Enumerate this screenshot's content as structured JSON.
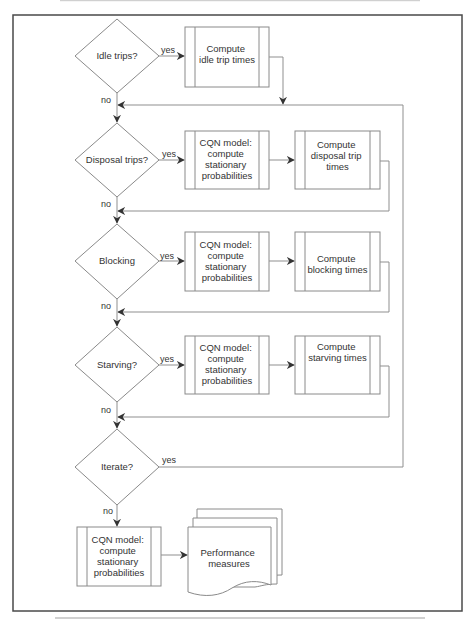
{
  "diagram": {
    "type": "flowchart",
    "colors": {
      "frame": "#4a4a4a",
      "shape_stroke": "#8a8a8a",
      "edge": "#8f8f8f",
      "text": "#333333",
      "background": "#ffffff"
    },
    "decisions": [
      {
        "id": "idle",
        "label": "Idle trips?",
        "yes_label": "yes",
        "no_label": "no"
      },
      {
        "id": "disposal",
        "label": "Disposal trips?",
        "yes_label": "yes",
        "no_label": "no"
      },
      {
        "id": "blocking",
        "label": "Blocking",
        "yes_label": "yes",
        "no_label": "no"
      },
      {
        "id": "starving",
        "label": "Starving?",
        "yes_label": "yes",
        "no_label": "no"
      },
      {
        "id": "iterate",
        "label": "Iterate?",
        "yes_label": "yes",
        "no_label": "no"
      }
    ],
    "processes": {
      "idle_compute": {
        "lines": [
          "Compute",
          "idle trip times"
        ]
      },
      "disposal_cqn": {
        "lines": [
          "CQN model:",
          "compute",
          "stationary",
          "probabilities"
        ]
      },
      "disposal_compute": {
        "lines": [
          "Compute",
          "disposal trip",
          "times"
        ]
      },
      "blocking_cqn": {
        "lines": [
          "CQN model:",
          "compute",
          "stationary",
          "probabilities"
        ]
      },
      "blocking_compute": {
        "lines": [
          "Compute",
          "blocking times"
        ]
      },
      "starving_cqn": {
        "lines": [
          "CQN model:",
          "compute",
          "stationary",
          "probabilities"
        ]
      },
      "starving_compute": {
        "lines": [
          "Compute",
          "starving times"
        ]
      },
      "final_cqn": {
        "lines": [
          "CQN model:",
          "compute",
          "stationary",
          "probabilities"
        ]
      }
    },
    "output_document": {
      "lines": [
        "Performance",
        "measures"
      ]
    }
  }
}
